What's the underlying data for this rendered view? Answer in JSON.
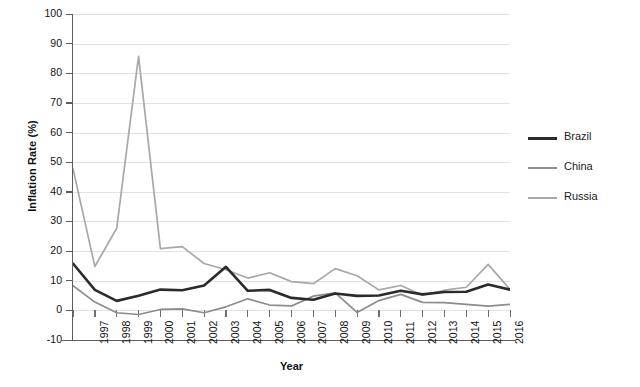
{
  "chart_data": {
    "type": "line",
    "title": "",
    "xlabel": "Year",
    "ylabel": "Inflation Rate (%)",
    "xlim": [
      1996,
      2016
    ],
    "ylim": [
      -10,
      100
    ],
    "ytick_values": [
      100,
      90,
      80,
      70,
      60,
      50,
      40,
      30,
      20,
      10,
      0,
      -10
    ],
    "ytick_labels": [
      "100",
      "90",
      "80",
      "70",
      "60",
      "50",
      "40",
      "30",
      "20",
      "10",
      "0",
      "-10"
    ],
    "categories": [
      1996,
      1997,
      1998,
      1999,
      2000,
      2001,
      2002,
      2003,
      2004,
      2005,
      2006,
      2007,
      2008,
      2009,
      2010,
      2011,
      2012,
      2013,
      2014,
      2015,
      2016
    ],
    "xtick_labels": [
      "",
      "1997",
      "1998",
      "1999",
      "2000",
      "2001",
      "2002",
      "2003",
      "2004",
      "2005",
      "2006",
      "2007",
      "2008",
      "2009",
      "2010",
      "2011",
      "2012",
      "2013",
      "2014",
      "2015",
      "2016"
    ],
    "grid": "horizontal",
    "legend_position": "right",
    "series": [
      {
        "name": "Brazil",
        "color": "#2b2b2b",
        "width": 2.6,
        "values": [
          15.8,
          6.9,
          3.2,
          4.9,
          7.0,
          6.8,
          8.4,
          14.7,
          6.6,
          6.9,
          4.2,
          3.6,
          5.7,
          4.9,
          5.0,
          6.6,
          5.4,
          6.2,
          6.3,
          8.7,
          7.0
        ]
      },
      {
        "name": "China",
        "color": "#8c8c8c",
        "width": 1.7,
        "values": [
          8.3,
          2.8,
          -0.8,
          -1.4,
          0.3,
          0.5,
          -0.8,
          1.2,
          3.9,
          1.8,
          1.5,
          4.8,
          5.9,
          -0.7,
          3.3,
          5.4,
          2.7,
          2.6,
          2.0,
          1.4,
          2.0
        ]
      },
      {
        "name": "Russia",
        "color": "#a8a8a8",
        "width": 1.7,
        "values": [
          47.8,
          14.8,
          27.7,
          85.7,
          20.8,
          21.5,
          15.8,
          13.7,
          10.9,
          12.7,
          9.7,
          9.0,
          14.1,
          11.7,
          6.9,
          8.4,
          5.1,
          6.8,
          7.8,
          15.5,
          7.1
        ]
      }
    ]
  },
  "legend": {
    "items": [
      {
        "label": "Brazil"
      },
      {
        "label": "China"
      },
      {
        "label": "Russia"
      }
    ]
  },
  "source_note": ""
}
